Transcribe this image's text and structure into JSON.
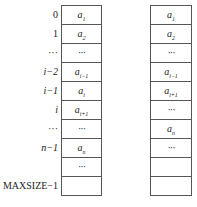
{
  "index_labels": [
    "0",
    "1",
    "···",
    "i−2",
    "i−1",
    "i",
    "···",
    "n−1",
    "",
    "MAXSIZE−1"
  ],
  "left_table": {
    "cells": [
      {
        "base": "a",
        "sub": "1"
      },
      {
        "base": "a",
        "sub": "2"
      },
      {
        "base": "···",
        "sub": ""
      },
      {
        "base": "a",
        "sub": "i−1"
      },
      {
        "base": "a",
        "sub": "i"
      },
      {
        "base": "a",
        "sub": "i+1"
      },
      {
        "base": "···",
        "sub": ""
      },
      {
        "base": "a",
        "sub": "n"
      },
      {
        "base": "···",
        "sub": ""
      },
      {
        "base": "",
        "sub": ""
      }
    ]
  },
  "right_table": {
    "cells": [
      {
        "base": "a",
        "sub": "1"
      },
      {
        "base": "a",
        "sub": "2"
      },
      {
        "base": "···",
        "sub": ""
      },
      {
        "base": "a",
        "sub": "i−1"
      },
      {
        "base": "a",
        "sub": "i+1"
      },
      {
        "base": "···",
        "sub": ""
      },
      {
        "base": "a",
        "sub": "n"
      },
      {
        "base": "···",
        "sub": ""
      },
      {
        "base": "",
        "sub": ""
      },
      {
        "base": "",
        "sub": ""
      }
    ]
  }
}
